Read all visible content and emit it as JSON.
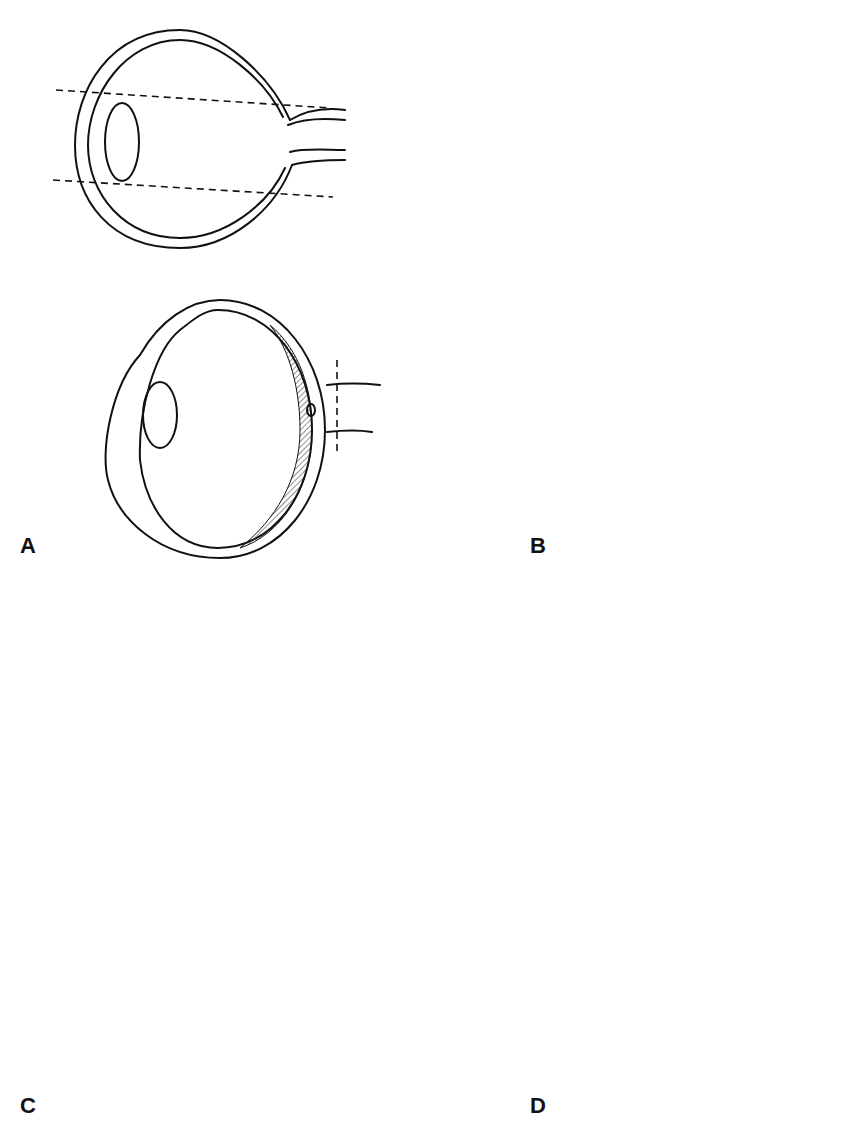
{
  "figure": {
    "panels": [
      {
        "id": "A",
        "label": "A",
        "description": "Eye cross-sections with dashed cut lines"
      },
      {
        "id": "B",
        "label": "B",
        "description": "Globe split into cap, central band with optic nerve stump, and lower cup"
      },
      {
        "id": "C",
        "label": "C",
        "description": "Fingers holding globe while razor blade cuts near optic nerve"
      },
      {
        "id": "D",
        "label": "D",
        "description": "Globe opened along dashed line with arrows showing cut direction"
      }
    ],
    "colors": {
      "ink": "#111111",
      "background": "#ffffff"
    }
  }
}
